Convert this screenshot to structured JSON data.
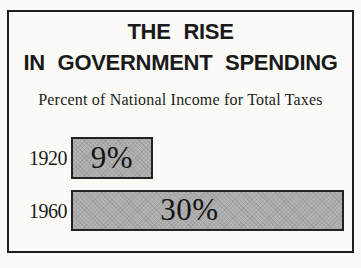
{
  "chart": {
    "title_line1": "THE RISE",
    "title_line2": "IN GOVERNMENT SPENDING",
    "subtitle": "Percent of National Income for Total Taxes",
    "rows": [
      {
        "year": "1920",
        "value_label": "9%"
      },
      {
        "year": "1960",
        "value_label": "30%"
      }
    ],
    "colors": {
      "bar_fill": "#b3b3b3",
      "bar_border": "#222222",
      "frame_border": "#1f1f1f",
      "text": "#1c1c1c",
      "background": "#fbfaf7"
    }
  },
  "chart_data": {
    "type": "bar",
    "orientation": "horizontal",
    "title": "THE RISE IN GOVERNMENT SPENDING",
    "subtitle": "Percent of National Income for Total Taxes",
    "categories": [
      "1920",
      "1960"
    ],
    "values": [
      9,
      30
    ],
    "value_labels": [
      "9%",
      "30%"
    ],
    "xlabel": "Percent of National Income for Total Taxes",
    "xlim": [
      0,
      30
    ],
    "grid": false,
    "legend": false
  }
}
